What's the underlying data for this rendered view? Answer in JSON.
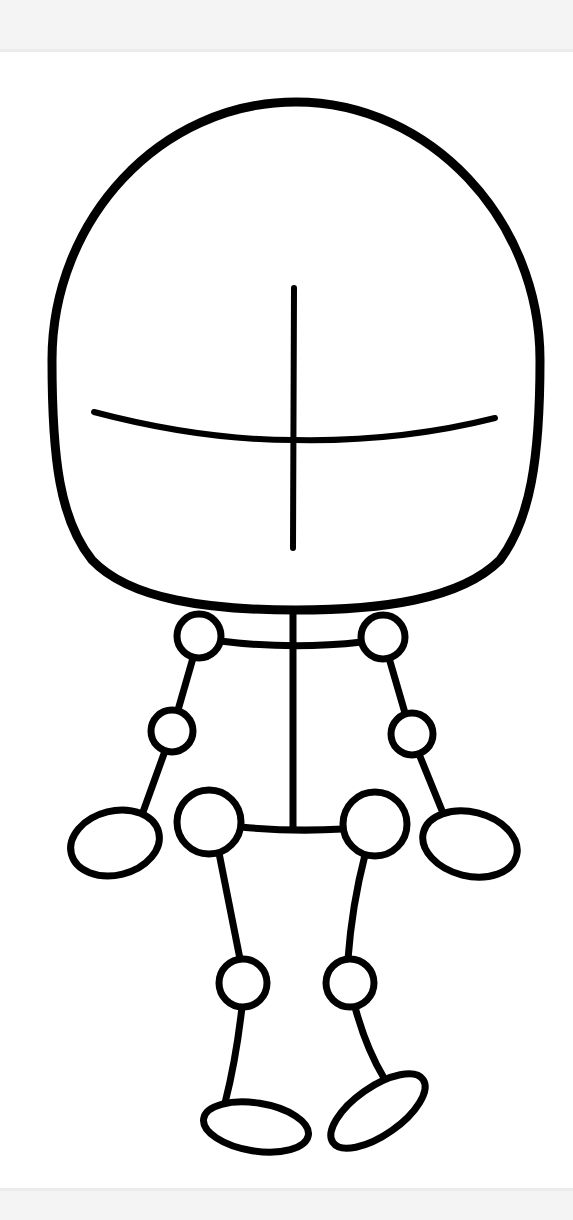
{
  "canvas": {
    "width": 573,
    "height": 1220,
    "background": "#ffffff"
  },
  "bands": {
    "top_color": "#f4f4f4",
    "bottom_color": "#f4f4f4"
  },
  "figure": {
    "title": "",
    "stroke_color": "#000000",
    "head": {
      "cx": 296,
      "top": 102,
      "left": 52,
      "right": 540,
      "bottom": 610
    },
    "face_guides": {
      "vertical": {
        "x": 294,
        "y1": 288,
        "y2": 548
      },
      "horizontal": {
        "x1": 94,
        "y1": 412,
        "mid_x": 294,
        "mid_y": 440,
        "x2": 495,
        "y2": 418
      }
    },
    "joints": {
      "left_shoulder": {
        "cx": 199,
        "cy": 636,
        "r": 22
      },
      "right_shoulder": {
        "cx": 383,
        "cy": 637,
        "r": 22
      },
      "left_elbow": {
        "cx": 172,
        "cy": 731,
        "r": 21
      },
      "right_elbow": {
        "cx": 412,
        "cy": 734,
        "r": 21
      },
      "left_hip": {
        "cx": 209,
        "cy": 822,
        "r": 32
      },
      "right_hip": {
        "cx": 375,
        "cy": 824,
        "r": 32
      },
      "left_knee": {
        "cx": 243,
        "cy": 983,
        "r": 24
      },
      "right_knee": {
        "cx": 350,
        "cy": 983,
        "r": 24
      }
    },
    "hands": {
      "left": {
        "cx": 115,
        "cy": 843,
        "rx": 45,
        "ry": 32,
        "rotate": -14
      },
      "right": {
        "cx": 470,
        "cy": 844,
        "rx": 48,
        "ry": 32,
        "rotate": 14
      }
    },
    "feet": {
      "left": {
        "cx": 256,
        "cy": 1127,
        "rx": 53,
        "ry": 24,
        "rotate": 9
      },
      "right": {
        "cx": 378,
        "cy": 1111,
        "rx": 55,
        "ry": 24,
        "rotate": -35
      }
    }
  }
}
